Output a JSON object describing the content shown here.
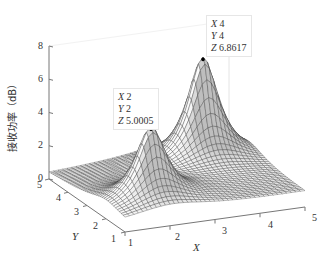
{
  "chart_data": {
    "type": "surface",
    "title": "",
    "xlabel": "X",
    "ylabel": "Y",
    "zlabel": "接收功率（dB）",
    "xlim": [
      1,
      5
    ],
    "ylim": [
      1,
      5
    ],
    "zlim": [
      0,
      8
    ],
    "xticks": [
      "1",
      "2",
      "3",
      "4",
      "5"
    ],
    "yticks": [
      "1",
      "2",
      "3",
      "4",
      "5"
    ],
    "zticks": [
      "0",
      "2",
      "4",
      "6",
      "8"
    ],
    "grid": false,
    "mesh_resolution": 41,
    "peaks": [
      {
        "x": 2,
        "y": 2,
        "z": 5.0005
      },
      {
        "x": 4,
        "y": 4,
        "z": 6.8617
      }
    ],
    "datatips": [
      {
        "x_label": "X",
        "x_value": "2",
        "y_label": "Y",
        "y_value": "2",
        "z_label": "Z",
        "z_value": "5.0005"
      },
      {
        "x_label": "X",
        "x_value": "4",
        "y_label": "Y",
        "y_value": "4",
        "z_label": "Z",
        "z_value": "6.8617"
      }
    ]
  }
}
